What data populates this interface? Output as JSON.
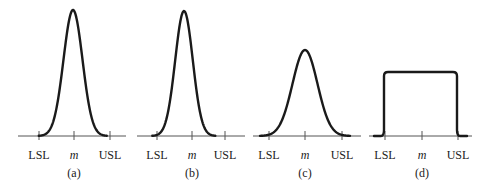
{
  "figure": {
    "axis_y": 136,
    "label_y": 159,
    "caption_y": 177,
    "colors": {
      "curve": "#1a1a1a",
      "axis": "#555555",
      "text": "#222222"
    },
    "panels": [
      {
        "id": "a",
        "caption": "(a)",
        "shape": "normal",
        "axis": [
          18,
          126
        ],
        "ticks": {
          "LSL": 39,
          "m": 74,
          "USL": 110
        },
        "labels": {
          "lsl": "LSL",
          "m": "m",
          "usl": "USL"
        },
        "peak_x": 73,
        "peak_y": 10,
        "sigma": 9.5
      },
      {
        "id": "b",
        "caption": "(b)",
        "shape": "normal",
        "axis": [
          137,
          245
        ],
        "ticks": {
          "LSL": 157,
          "m": 192,
          "USL": 225
        },
        "labels": {
          "lsl": "LSL",
          "m": "m",
          "usl": "USL"
        },
        "peak_x": 184,
        "peak_y": 11,
        "sigma": 8.8
      },
      {
        "id": "c",
        "caption": "(c)",
        "shape": "normal",
        "axis": [
          253,
          361
        ],
        "ticks": {
          "LSL": 269,
          "m": 305,
          "USL": 342
        },
        "labels": {
          "lsl": "LSL",
          "m": "m",
          "usl": "USL"
        },
        "peak_x": 305,
        "peak_y": 50,
        "sigma": 12.5
      },
      {
        "id": "d",
        "caption": "(d)",
        "shape": "uniform",
        "axis": [
          369,
          472
        ],
        "ticks": {
          "LSL": 385,
          "m": 422,
          "USL": 458
        },
        "labels": {
          "lsl": "LSL",
          "m": "m",
          "usl": "USL"
        },
        "left_x": 384,
        "right_x": 457,
        "top_y": 72
      }
    ]
  }
}
